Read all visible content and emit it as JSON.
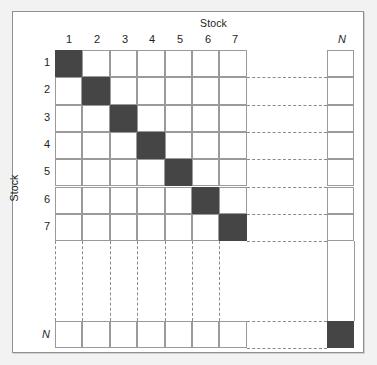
{
  "figure": {
    "type": "matrix-diagram",
    "axes": {
      "column_title": "Stock",
      "row_title": "Stock"
    },
    "column_ticks": [
      "1",
      "2",
      "3",
      "4",
      "5",
      "6",
      "7",
      "N"
    ],
    "row_ticks": [
      "1",
      "2",
      "3",
      "4",
      "5",
      "6",
      "7",
      "N"
    ],
    "ellipsis_marker": "dashed",
    "colors": {
      "filled_cell": "#454545",
      "empty_cell": "#ffffff",
      "grid_line": "#9a9a9a",
      "dashed_line": "#8a8a8a",
      "frame_border": "#8d8f92",
      "page_background": "#f2f2f2"
    }
  },
  "chart_data": {
    "type": "heatmap",
    "title": "",
    "subtitle": "",
    "xlabel": "Stock",
    "ylabel": "Stock",
    "xticklabels": [
      "1",
      "2",
      "3",
      "4",
      "5",
      "6",
      "7",
      "N"
    ],
    "yticklabels": [
      "1",
      "2",
      "3",
      "4",
      "5",
      "6",
      "7",
      "N"
    ],
    "grid": true,
    "legend": "none",
    "annotations": [
      "dashed lines indicate continuation of rows/columns 8 .. N-1"
    ],
    "value_labels": {
      "0": "off-diagonal (empty)",
      "1": "diagonal (filled)"
    },
    "matrix": [
      [
        1,
        0,
        0,
        0,
        0,
        0,
        0,
        0
      ],
      [
        0,
        1,
        0,
        0,
        0,
        0,
        0,
        0
      ],
      [
        0,
        0,
        1,
        0,
        0,
        0,
        0,
        0
      ],
      [
        0,
        0,
        0,
        1,
        0,
        0,
        0,
        0
      ],
      [
        0,
        0,
        0,
        0,
        1,
        0,
        0,
        0
      ],
      [
        0,
        0,
        0,
        0,
        0,
        1,
        0,
        0
      ],
      [
        0,
        0,
        0,
        0,
        0,
        0,
        1,
        0
      ],
      [
        0,
        0,
        0,
        0,
        0,
        0,
        0,
        1
      ]
    ]
  }
}
